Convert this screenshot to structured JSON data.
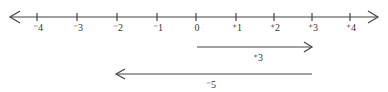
{
  "diagram": {
    "type": "number-line",
    "ticks": [
      {
        "value": -4,
        "label": "⁻4",
        "x": 37
      },
      {
        "value": -3,
        "label": "⁻3",
        "x": 77
      },
      {
        "value": -2,
        "label": "⁻2",
        "x": 117
      },
      {
        "value": -1,
        "label": "⁻1",
        "x": 157
      },
      {
        "value": 0,
        "label": "0",
        "x": 196
      },
      {
        "value": 1,
        "label": "⁺1",
        "x": 236
      },
      {
        "value": 2,
        "label": "⁺2",
        "x": 274
      },
      {
        "value": 3,
        "label": "⁺3",
        "x": 312
      },
      {
        "value": 4,
        "label": "⁺4",
        "x": 350
      }
    ],
    "vectors": [
      {
        "label": "⁺3",
        "from": 0,
        "to": 3
      },
      {
        "label": "⁻5",
        "from": 3,
        "to": -2
      }
    ],
    "color": "#444444"
  }
}
